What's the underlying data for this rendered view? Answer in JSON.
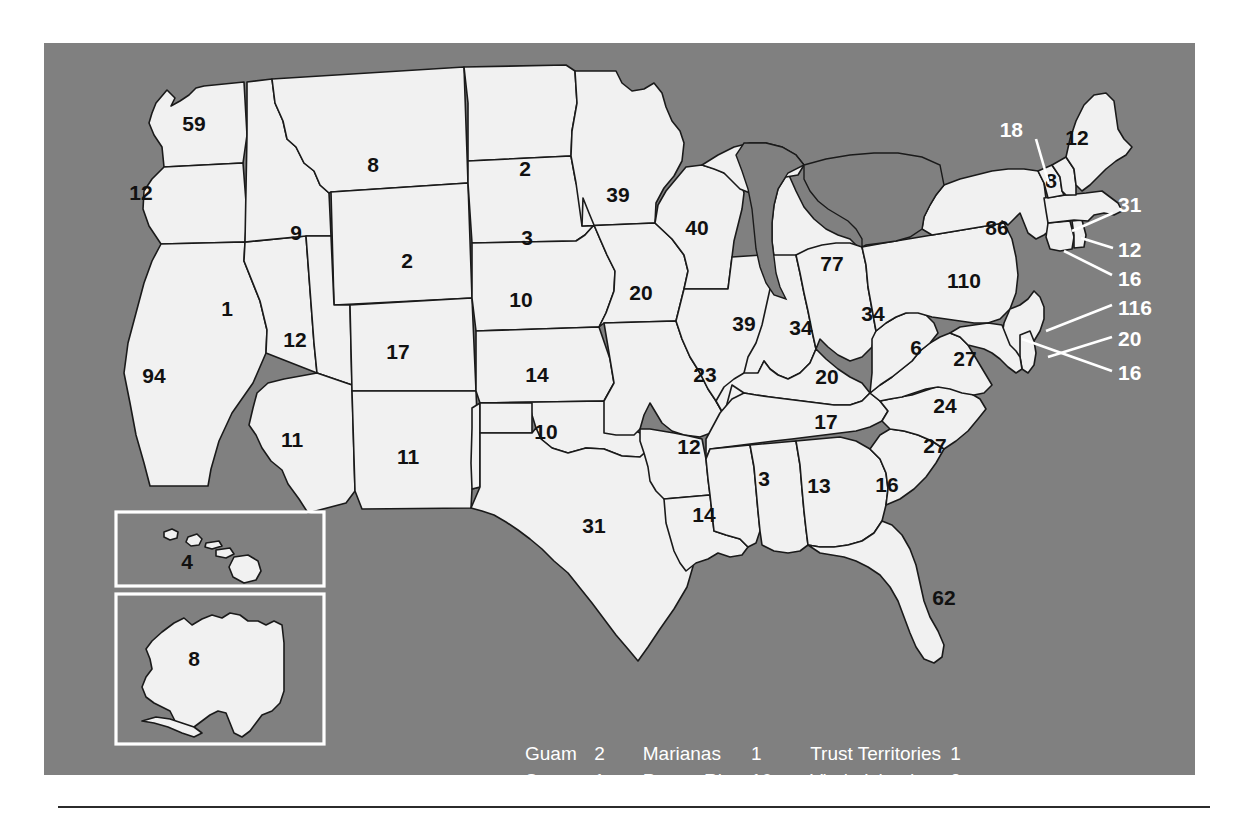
{
  "figure": {
    "background_color": "#808080",
    "state_fill_color": "#f1f1f1",
    "outline_color": "#1a1a1a",
    "label_color_inside": "#111111",
    "label_color_outside": "#ffffff"
  },
  "chart_data": {
    "type": "map",
    "title": "",
    "subtitle": "",
    "xlabel": "",
    "ylabel": "",
    "legend_position": "bottom-center",
    "grid": false,
    "categories": [
      "Washington",
      "Oregon",
      "California",
      "Nevada",
      "Idaho",
      "Montana",
      "Wyoming",
      "Utah",
      "Arizona",
      "Colorado",
      "New Mexico",
      "North Dakota",
      "South Dakota",
      "Nebraska",
      "Kansas",
      "Oklahoma",
      "Texas",
      "Minnesota",
      "Iowa",
      "Missouri",
      "Arkansas",
      "Louisiana",
      "Wisconsin",
      "Illinois",
      "Michigan",
      "Indiana",
      "Ohio",
      "Kentucky",
      "Tennessee",
      "Mississippi",
      "Alabama",
      "Georgia",
      "Florida",
      "South Carolina",
      "North Carolina",
      "Virginia",
      "West Virginia",
      "Maryland",
      "Delaware",
      "Pennsylvania",
      "New Jersey",
      "New York",
      "Connecticut",
      "Rhode Island",
      "Massachusetts",
      "Vermont",
      "New Hampshire",
      "Maine",
      "Hawaii",
      "Alaska"
    ],
    "values": [
      59,
      12,
      94,
      1,
      9,
      8,
      2,
      12,
      11,
      17,
      11,
      2,
      3,
      10,
      14,
      10,
      31,
      39,
      20,
      23,
      12,
      14,
      40,
      39,
      77,
      34,
      34,
      20,
      17,
      3,
      13,
      16,
      62,
      27,
      24,
      27,
      6,
      16,
      20,
      110,
      116,
      86,
      16,
      12,
      31,
      18,
      8,
      12,
      4,
      8
    ]
  },
  "map": {
    "states": [
      {
        "name": "Washington",
        "value": "59",
        "x": 150,
        "y": 82,
        "outside": false
      },
      {
        "name": "Oregon",
        "value": "12",
        "x": 97,
        "y": 151,
        "outside": false
      },
      {
        "name": "California",
        "value": "94",
        "x": 110,
        "y": 334,
        "outside": false
      },
      {
        "name": "Nevada",
        "value": "1",
        "x": 183,
        "y": 267,
        "outside": false
      },
      {
        "name": "Idaho",
        "value": "9",
        "x": 252,
        "y": 191,
        "outside": false
      },
      {
        "name": "Montana",
        "value": "8",
        "x": 329,
        "y": 123,
        "outside": false
      },
      {
        "name": "Wyoming",
        "value": "2",
        "x": 363,
        "y": 219,
        "outside": false
      },
      {
        "name": "Utah",
        "value": "12",
        "x": 251,
        "y": 298,
        "outside": false
      },
      {
        "name": "Arizona",
        "value": "11",
        "x": 248,
        "y": 398,
        "outside": false
      },
      {
        "name": "Colorado",
        "value": "17",
        "x": 354,
        "y": 310,
        "outside": false
      },
      {
        "name": "New Mexico",
        "value": "11",
        "x": 364,
        "y": 415,
        "outside": false
      },
      {
        "name": "North Dakota",
        "value": "2",
        "x": 481,
        "y": 127,
        "outside": false
      },
      {
        "name": "South Dakota",
        "value": "3",
        "x": 483,
        "y": 196,
        "outside": false
      },
      {
        "name": "Nebraska",
        "value": "10",
        "x": 477,
        "y": 258,
        "outside": false
      },
      {
        "name": "Kansas",
        "value": "14",
        "x": 493,
        "y": 333,
        "outside": false
      },
      {
        "name": "Oklahoma",
        "value": "10",
        "x": 502,
        "y": 390,
        "outside": false
      },
      {
        "name": "Texas",
        "value": "31",
        "x": 550,
        "y": 484,
        "outside": false
      },
      {
        "name": "Minnesota",
        "value": "39",
        "x": 574,
        "y": 153,
        "outside": false
      },
      {
        "name": "Iowa",
        "value": "20",
        "x": 597,
        "y": 251,
        "outside": false
      },
      {
        "name": "Missouri",
        "value": "23",
        "x": 661,
        "y": 333,
        "outside": false
      },
      {
        "name": "Arkansas",
        "value": "12",
        "x": 645,
        "y": 405,
        "outside": false
      },
      {
        "name": "Louisiana",
        "value": "14",
        "x": 660,
        "y": 473,
        "outside": false
      },
      {
        "name": "Wisconsin",
        "value": "40",
        "x": 653,
        "y": 186,
        "outside": false
      },
      {
        "name": "Illinois",
        "value": "39",
        "x": 700,
        "y": 282,
        "outside": false
      },
      {
        "name": "Michigan",
        "value": "77",
        "x": 788,
        "y": 222,
        "outside": false
      },
      {
        "name": "Indiana",
        "value": "34",
        "x": 757,
        "y": 286,
        "outside": false
      },
      {
        "name": "Ohio",
        "value": "34",
        "x": 829,
        "y": 272,
        "outside": false
      },
      {
        "name": "Kentucky",
        "value": "20",
        "x": 783,
        "y": 335,
        "outside": false
      },
      {
        "name": "Tennessee",
        "value": "17",
        "x": 782,
        "y": 380,
        "outside": false
      },
      {
        "name": "Mississippi",
        "value": "3",
        "x": 720,
        "y": 437,
        "outside": false
      },
      {
        "name": "Alabama",
        "value": "13",
        "x": 775,
        "y": 444,
        "outside": false
      },
      {
        "name": "Georgia",
        "value": "16",
        "x": 843,
        "y": 443,
        "outside": false
      },
      {
        "name": "Florida",
        "value": "62",
        "x": 900,
        "y": 556,
        "outside": false
      },
      {
        "name": "South Carolina",
        "value": "27",
        "x": 891,
        "y": 404,
        "outside": false
      },
      {
        "name": "North Carolina",
        "value": "24",
        "x": 901,
        "y": 364,
        "outside": false
      },
      {
        "name": "Virginia",
        "value": "27",
        "x": 921,
        "y": 317,
        "outside": false
      },
      {
        "name": "West Virginia",
        "value": "6",
        "x": 872,
        "y": 306,
        "outside": false
      },
      {
        "name": "Pennsylvania",
        "value": "110",
        "x": 920,
        "y": 239,
        "outside": false
      },
      {
        "name": "New York",
        "value": "86",
        "x": 953,
        "y": 186,
        "outside": false
      },
      {
        "name": "New Hampshire",
        "value": "8",
        "x": 1007,
        "y": 139,
        "outside": false
      },
      {
        "name": "Maine",
        "value": "12",
        "x": 1033,
        "y": 96,
        "outside": false
      }
    ],
    "callouts": [
      {
        "name": "Vermont",
        "value": "18",
        "lx": 979,
        "ly": 88,
        "x1": 992,
        "y1": 96,
        "x2": 1005,
        "y2": 141,
        "align": "end"
      },
      {
        "name": "Massachusetts",
        "value": "31",
        "lx": 1074,
        "ly": 163,
        "x1": 1069,
        "y1": 170,
        "x2": 1028,
        "y2": 188,
        "align": "start"
      },
      {
        "name": "Rhode Island",
        "value": "12",
        "lx": 1074,
        "ly": 208,
        "x1": 1069,
        "y1": 205,
        "x2": 1037,
        "y2": 195,
        "align": "start"
      },
      {
        "name": "Connecticut",
        "value": "16",
        "lx": 1074,
        "ly": 237,
        "x1": 1068,
        "y1": 232,
        "x2": 1020,
        "y2": 208,
        "align": "start"
      },
      {
        "name": "New Jersey",
        "value": "116",
        "lx": 1074,
        "ly": 266,
        "x1": 1068,
        "y1": 262,
        "x2": 1002,
        "y2": 288,
        "align": "start"
      },
      {
        "name": "Delaware",
        "value": "20",
        "lx": 1074,
        "ly": 297,
        "x1": 1068,
        "y1": 294,
        "x2": 1004,
        "y2": 314,
        "align": "start"
      },
      {
        "name": "Maryland",
        "value": "16",
        "lx": 1074,
        "ly": 331,
        "x1": 1068,
        "y1": 328,
        "x2": 978,
        "y2": 296,
        "align": "start"
      }
    ],
    "insets": [
      {
        "name": "Hawaii",
        "value": "4",
        "box": {
          "x": 72,
          "y": 469,
          "w": 208,
          "h": 74
        },
        "lx": 143,
        "ly": 520
      },
      {
        "name": "Alaska",
        "value": "8",
        "box": {
          "x": 72,
          "y": 551,
          "w": 208,
          "h": 150
        },
        "lx": 150,
        "ly": 617
      }
    ]
  },
  "legend": {
    "rows": [
      {
        "c1_name": "Guam",
        "c1_value": "2",
        "c2_name": "Marianas",
        "c2_value": "1",
        "c3_name": "Trust Territories",
        "c3_value": "1"
      },
      {
        "c1_name": "Samoa",
        "c1_value": "1",
        "c2_name": "Puerto Rico",
        "c2_value": "10",
        "c3_name": "Virgin Islands",
        "c3_value": "2"
      }
    ]
  }
}
